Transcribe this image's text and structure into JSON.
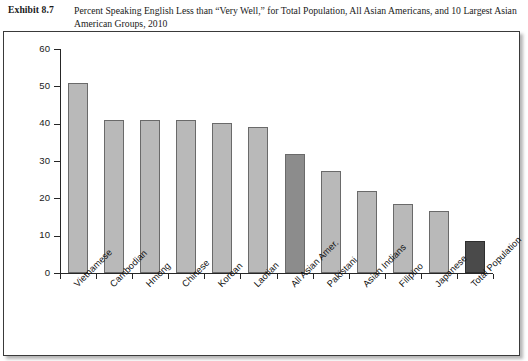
{
  "caption": {
    "exhibit_label": "Exhibit 8.7",
    "text": "Percent Speaking English Less than “Very Well,” for Total Population, All Asian Americans, and 10 Largest Asian American Groups, 2010"
  },
  "colors": {
    "bar_default": "#b9b9b9",
    "bar_highlight": "#8c8c8c",
    "bar_total": "#4a4a4a",
    "bar_stroke": "#6a6a6a",
    "axis": "#262626",
    "frame": "#3a3a3a",
    "background": "#ffffff"
  },
  "chart_data": {
    "type": "bar",
    "title": "Percent Speaking English Less than “Very Well,” for Total Population, All Asian Americans, and 10 Largest Asian American Groups, 2010",
    "xlabel": "",
    "ylabel": "",
    "ylim": [
      0,
      60
    ],
    "yticks": [
      0,
      10,
      20,
      30,
      40,
      50,
      60
    ],
    "ytick_labels": [
      "0",
      "10",
      "20",
      "30",
      "40",
      "50",
      "60"
    ],
    "grid": false,
    "legend": false,
    "categories": [
      "Vietnamese",
      "Cambodian",
      "Hmong",
      "Chinese",
      "Korean",
      "Laotian",
      "All Asian Amer.",
      "Pakistani",
      "Asian Indians",
      "Filipino",
      "Japanese",
      "Total Population"
    ],
    "values": [
      51,
      41,
      41,
      41,
      40.3,
      39,
      32,
      27.3,
      22,
      18.5,
      16.7,
      8.7
    ],
    "bar_styles": [
      "default",
      "default",
      "default",
      "default",
      "default",
      "default",
      "highlight",
      "default",
      "default",
      "default",
      "default",
      "total"
    ]
  }
}
